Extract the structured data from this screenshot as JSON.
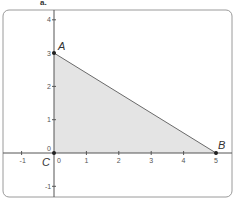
{
  "figure": {
    "label": "a.",
    "colors": {
      "panel_border": "#9a9a9a",
      "axis": "#555555",
      "triangle_fill": "#e4e4e4",
      "triangle_edge": "#6a6a6a",
      "point": "#222222"
    }
  },
  "axes": {
    "x_ticks": [
      {
        "value": -1,
        "label": "-1"
      },
      {
        "value": 0,
        "label": "0"
      },
      {
        "value": 1,
        "label": "1"
      },
      {
        "value": 2,
        "label": "2"
      },
      {
        "value": 3,
        "label": "3"
      },
      {
        "value": 4,
        "label": "4"
      },
      {
        "value": 5,
        "label": "5"
      }
    ],
    "y_ticks": [
      {
        "value": -1,
        "label": "-1"
      },
      {
        "value": 0,
        "label": "0"
      },
      {
        "value": 1,
        "label": "1"
      },
      {
        "value": 2,
        "label": "2"
      },
      {
        "value": 3,
        "label": "3"
      },
      {
        "value": 4,
        "label": "4"
      }
    ]
  },
  "points": [
    {
      "name": "A",
      "x": 0,
      "y": 3
    },
    {
      "name": "B",
      "x": 5,
      "y": 0
    },
    {
      "name": "C",
      "x": 0,
      "y": 0
    }
  ]
}
